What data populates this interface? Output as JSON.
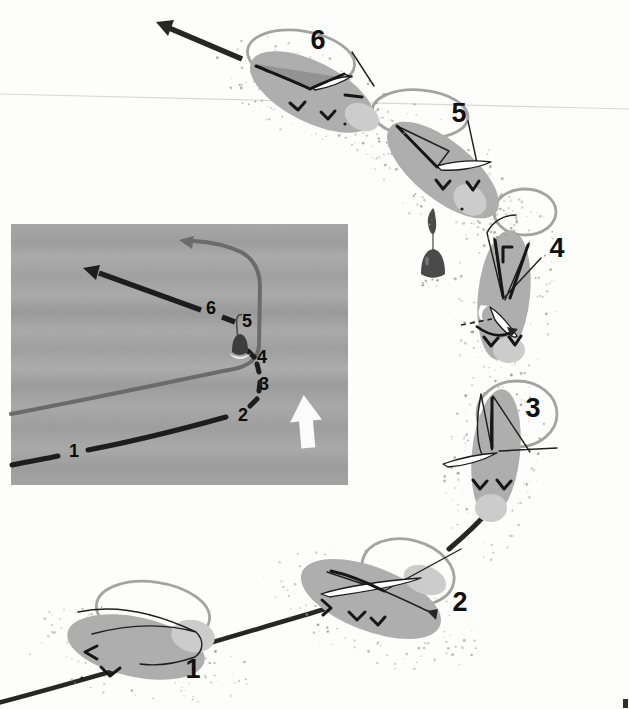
{
  "diagram": {
    "main_sequence": {
      "figures": [
        {
          "label": "1"
        },
        {
          "label": "2"
        },
        {
          "label": "3"
        },
        {
          "label": "4"
        },
        {
          "label": "5"
        },
        {
          "label": "6"
        }
      ]
    },
    "inset": {
      "labels": [
        "1",
        "2",
        "3",
        "4",
        "5",
        "6"
      ],
      "flow_arrow_direction": "up"
    },
    "colors": {
      "bg": "#fdfdfc",
      "ink": "#262626",
      "label_ink": "#111111",
      "body_gray": "#aeaeae",
      "body_light": "#cccccc",
      "wing_gray": "#8f8f8f",
      "loop_gray": "#a3a3a3",
      "stipple_gray": "#8f8f8f",
      "inset_gray_path": "#6b6b6b",
      "white_arrow": "#fbfbfb",
      "crease": "#d8d8d8",
      "drop_dark": "#4a4a4a"
    }
  }
}
